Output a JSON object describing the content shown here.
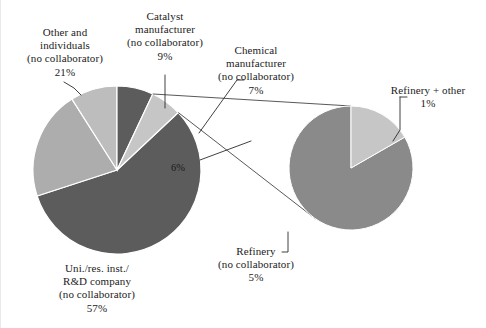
{
  "figure": {
    "background_color": "#ffffff",
    "text_color": "#1b1b1b",
    "line_color": "#2b2b2b"
  },
  "chart_data": {
    "type": "pie",
    "title": "",
    "subtitle": "",
    "xlabel": "",
    "ylabel": "",
    "legend_position": "none",
    "grid": false,
    "units": "percent of total",
    "total": 100,
    "categories": [
      "Uni./res. inst./R&D company (no collaborator)",
      "Other and individuals (no collaborator)",
      "Catalyst manufacturer (no collaborator)",
      "Chemical manufacturer (no collaborator)",
      "Refinery (no collaborator) + Refinery + other"
    ],
    "values": [
      57,
      21,
      9,
      7,
      6
    ],
    "colors": [
      "#5c5c5c",
      "#b0b0b0",
      "#b9b9b9",
      "#5c5c5c",
      "#c3c3c3"
    ],
    "main_pie": {
      "center_x": 116,
      "center_y": 170,
      "radius": 84,
      "slices": [
        {
          "name": "uni-res-rd",
          "label": "Uni./res. inst./R&D company (no collaborator)",
          "percent": 57,
          "value_text": "57%",
          "color": "#5c5c5c",
          "start_deg": 21.6,
          "end_deg": 226.8
        },
        {
          "name": "other-individuals",
          "label": "Other and individuals (no collaborator)",
          "percent": 21,
          "value_text": "21%",
          "color": "#adadad",
          "start_deg": 226.8,
          "end_deg": 302.4
        },
        {
          "name": "catalyst-manufacturer",
          "label": "Catalyst manufacturer (no collaborator)",
          "percent": 9,
          "value_text": "9%",
          "color": "#bdbdbd",
          "start_deg": 302.4,
          "end_deg": 334.8
        },
        {
          "name": "chemical-manufacturer",
          "label": "Chemical manufacturer (no collaborator)",
          "percent": 7,
          "value_text": "7%",
          "color": "#5c5c5c",
          "start_deg": 334.8,
          "end_deg": 360.0
        },
        {
          "name": "refinery-group",
          "label": "Refinery group (exploded)",
          "percent": 6,
          "value_text": "6%",
          "color": "#c6c6c6",
          "start_deg": 0.0,
          "end_deg": 21.6
        }
      ]
    },
    "secondary_pie": {
      "name": "refinery-breakout",
      "center_x": 350,
      "center_y": 168,
      "radius": 62,
      "parent_percent": 6,
      "slices": [
        {
          "name": "refinery-no-collaborator",
          "label": "Refinery (no collaborator)",
          "percent_of_total": 5,
          "value_text": "5%",
          "share_of_breakout": 83.3,
          "color": "#8a8a8a",
          "start_deg": 328.0,
          "end_deg": 688.0
        },
        {
          "name": "refinery-plus-other",
          "label": "Refinery + other",
          "percent_of_total": 1,
          "value_text": "1%",
          "share_of_breakout": 16.7,
          "color": "#c6c6c6",
          "start_deg": 268.0,
          "end_deg": 328.0
        }
      ]
    }
  },
  "labels": {
    "other_individuals": {
      "line1": "Other and",
      "line2": "individuals",
      "line3": "(no collaborator)",
      "line4": "21%"
    },
    "catalyst_manufacturer": {
      "line1": "Catalyst",
      "line2": "manufacturer",
      "line3": "(no collaborator)",
      "line4": "9%"
    },
    "chemical_manufacturer": {
      "line1": "Chemical",
      "line2": "manufacturer",
      "line3": "(no collaborator)",
      "line4": "7%"
    },
    "refinery_plus_other": {
      "line1": "Refinery + other",
      "line2": "1%"
    },
    "refinery_no_collaborator": {
      "line1": "Refinery",
      "line2": "(no collaborator)",
      "line3": "5%"
    },
    "uni_res_rd": {
      "line1": "Uni./res. inst./",
      "line2": "R&D company",
      "line3": "(no collaborator)",
      "line4": "57%"
    },
    "inside_six_percent": "6%"
  }
}
